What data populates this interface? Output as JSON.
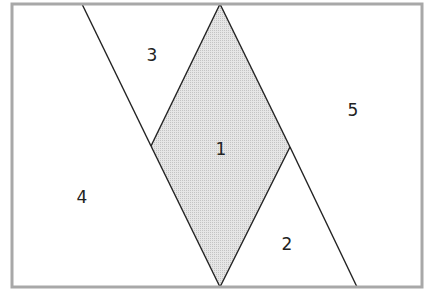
{
  "diagram": {
    "type": "partitioned-rectangle",
    "colors": {
      "frame": "#a8a8a8",
      "line": "#222222",
      "shaded_fill": "#d9d9d9",
      "background": "#ffffff"
    },
    "regions": [
      {
        "id": "1",
        "label": "1",
        "shaded": true,
        "shape": "rhombus"
      },
      {
        "id": "2",
        "label": "2",
        "shaded": false,
        "shape": "triangle"
      },
      {
        "id": "3",
        "label": "3",
        "shaded": false,
        "shape": "triangle"
      },
      {
        "id": "4",
        "label": "4",
        "shaded": false,
        "shape": "trapezoid"
      },
      {
        "id": "5",
        "label": "5",
        "shaded": false,
        "shape": "trapezoid"
      }
    ]
  }
}
